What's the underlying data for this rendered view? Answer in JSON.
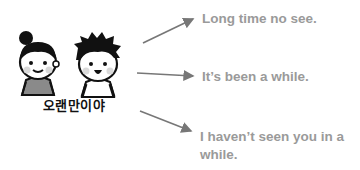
{
  "illustration": {
    "characters": [
      "girl-with-bun",
      "boy-with-spiky-hair"
    ],
    "korean_phrase": "오랜만이야",
    "colors": {
      "line": "#111111",
      "cheek": "#d9d9d9",
      "shirt": "#8a8a8a"
    }
  },
  "meanings": [
    {
      "text": "Long time no see."
    },
    {
      "text": "It’s been a while."
    },
    {
      "text": "I haven’t seen you in a while."
    }
  ],
  "colors": {
    "meaning_text": "#9a9a9a",
    "arrow": "#777777"
  }
}
